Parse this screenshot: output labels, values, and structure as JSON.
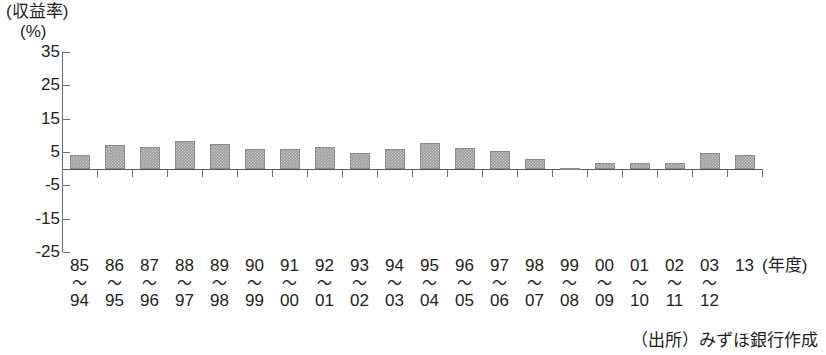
{
  "chart_data": {
    "type": "bar",
    "title": "",
    "subtitle": "",
    "xlabel": "(年度)",
    "ylabel": "(収益率)(%)",
    "ylabel_lines": [
      "(収益率)",
      "(%)"
    ],
    "ylim": [
      -25,
      35
    ],
    "yticks": [
      35,
      25,
      15,
      5,
      -5,
      -15,
      -25
    ],
    "ytick_labels": [
      "35",
      "25",
      "15",
      "5",
      "-5",
      "-15",
      "-25"
    ],
    "grid": false,
    "legend": null,
    "zero_line": 0,
    "bar_color": "#9b9b9b",
    "categories": [
      "85\n～\n94",
      "86\n～\n95",
      "87\n～\n96",
      "88\n～\n97",
      "89\n～\n98",
      "90\n～\n99",
      "91\n～\n00",
      "92\n～\n01",
      "93\n～\n02",
      "94\n～\n03",
      "95\n～\n04",
      "96\n～\n05",
      "97\n～\n06",
      "98\n～\n07",
      "99\n～\n08",
      "00\n～\n09",
      "01\n～\n10",
      "02\n～\n11",
      "03\n～\n12",
      "13"
    ],
    "category_parts": [
      {
        "from": "85",
        "tilde": "～",
        "to": "94"
      },
      {
        "from": "86",
        "tilde": "～",
        "to": "95"
      },
      {
        "from": "87",
        "tilde": "～",
        "to": "96"
      },
      {
        "from": "88",
        "tilde": "～",
        "to": "97"
      },
      {
        "from": "89",
        "tilde": "～",
        "to": "98"
      },
      {
        "from": "90",
        "tilde": "～",
        "to": "99"
      },
      {
        "from": "91",
        "tilde": "～",
        "to": "00"
      },
      {
        "from": "92",
        "tilde": "～",
        "to": "01"
      },
      {
        "from": "93",
        "tilde": "～",
        "to": "02"
      },
      {
        "from": "94",
        "tilde": "～",
        "to": "03"
      },
      {
        "from": "95",
        "tilde": "～",
        "to": "04"
      },
      {
        "from": "96",
        "tilde": "～",
        "to": "05"
      },
      {
        "from": "97",
        "tilde": "～",
        "to": "06"
      },
      {
        "from": "98",
        "tilde": "～",
        "to": "07"
      },
      {
        "from": "99",
        "tilde": "～",
        "to": "08"
      },
      {
        "from": "00",
        "tilde": "～",
        "to": "09"
      },
      {
        "from": "01",
        "tilde": "～",
        "to": "10"
      },
      {
        "from": "02",
        "tilde": "～",
        "to": "11"
      },
      {
        "from": "03",
        "tilde": "～",
        "to": "12"
      },
      {
        "from": "13",
        "tilde": "",
        "to": ""
      }
    ],
    "values": [
      4.0,
      7.0,
      6.5,
      8.2,
      7.4,
      6.0,
      6.0,
      6.4,
      4.6,
      6.0,
      7.6,
      6.2,
      5.4,
      3.0,
      0.2,
      1.6,
      1.6,
      1.8,
      4.6,
      4.2
    ]
  },
  "source": {
    "text": "（出所）みずほ銀行作成"
  }
}
